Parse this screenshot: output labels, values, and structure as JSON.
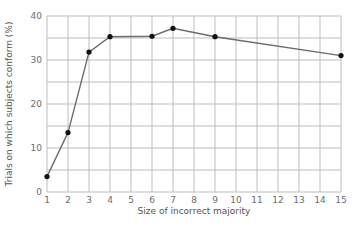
{
  "chart_data": {
    "type": "line",
    "title": "",
    "xlabel": "Size of incorrect majority",
    "ylabel": "Trials on which subjects conform (%)",
    "xlim": [
      1,
      15
    ],
    "ylim": [
      0,
      40
    ],
    "x_ticks": [
      1,
      2,
      3,
      4,
      5,
      6,
      7,
      8,
      9,
      10,
      11,
      12,
      13,
      14,
      15
    ],
    "y_ticks": [
      0,
      10,
      20,
      30,
      40
    ],
    "y_minor_grid_step": 5,
    "grid": true,
    "legend": null,
    "series": [
      {
        "name": "Conformity",
        "x": [
          1,
          2,
          3,
          4,
          6,
          7,
          9,
          15
        ],
        "values": [
          3.5,
          13.5,
          31.8,
          35.3,
          35.4,
          37.2,
          35.3,
          31.0
        ]
      }
    ]
  },
  "colors": {
    "line": "#6b6b6b",
    "marker": "#111111",
    "grid": "#bdbdbd",
    "tick_text": "#6d6d6d"
  }
}
